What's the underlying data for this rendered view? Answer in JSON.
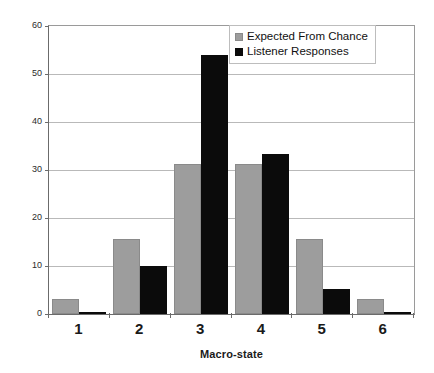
{
  "chart_data": {
    "type": "bar",
    "title": "",
    "subtitle": "",
    "xlabel": "Macro-state",
    "ylabel": "Frequency (%)",
    "categories": [
      "1",
      "2",
      "3",
      "4",
      "5",
      "6"
    ],
    "series": [
      {
        "name": "Expected From Chance",
        "color": "#9d9d9d",
        "values": [
          3.1,
          15.6,
          31.3,
          31.3,
          15.6,
          3.1
        ]
      },
      {
        "name": "Listener Responses",
        "color": "#0b0b0b",
        "values": [
          0.5,
          10.1,
          54.0,
          33.3,
          5.2,
          0.3
        ]
      }
    ],
    "ylim": [
      0,
      60
    ],
    "yticks": [
      0,
      10,
      20,
      30,
      40,
      50,
      60
    ],
    "ytick_labels": [
      "0",
      "10",
      "20",
      "30",
      "40",
      "50",
      "60"
    ],
    "grid": true,
    "grid_axis": "y",
    "legend_position": "top-right",
    "legend_entries": [
      "Expected From Chance",
      "Listener Responses"
    ]
  },
  "legend": {
    "items": [
      {
        "label": "Expected From Chance",
        "swatch": "expected-swatch-icon"
      },
      {
        "label": "Listener Responses",
        "swatch": "listener-swatch-icon"
      }
    ]
  }
}
